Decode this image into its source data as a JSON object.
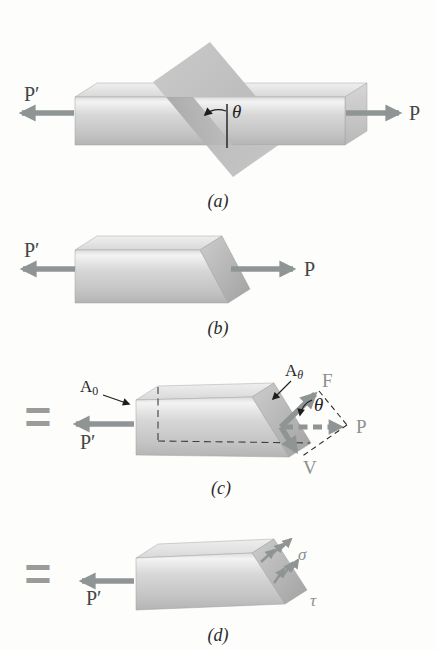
{
  "colors": {
    "force_arrow": "#8f9494",
    "dark_label": "#454545",
    "gray_label": "#8b9090",
    "equals_sign": "#9b9b9b",
    "bar_light": "#f0f0f0",
    "bar_dark": "#b5b5b5"
  },
  "figures": {
    "a": {
      "caption": "(a)",
      "p_prime": "P′",
      "p": "P",
      "theta": "θ"
    },
    "b": {
      "caption": "(b)",
      "p_prime": "P′",
      "p": "P"
    },
    "c": {
      "caption": "(c)",
      "equals": "=",
      "p_prime": "P′",
      "p": "P",
      "f": "F",
      "v": "V",
      "theta": "θ",
      "area0_base": "A",
      "area0_sub": "0",
      "area_theta_base": "A",
      "area_theta_sub": "θ"
    },
    "d": {
      "caption": "(d)",
      "equals": "=",
      "p_prime": "P′",
      "sigma": "σ",
      "tau": "τ"
    }
  }
}
